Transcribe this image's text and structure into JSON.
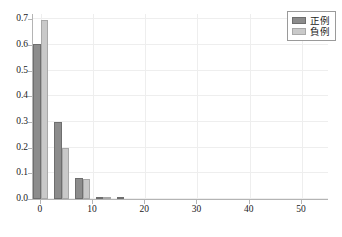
{
  "chart_data": {
    "type": "bar",
    "title": "",
    "subtitle": "",
    "xlabel": "",
    "ylabel": "",
    "xlim": [
      -1.5,
      55
    ],
    "ylim": [
      0.0,
      0.72
    ],
    "grid": true,
    "legend_position": "top-right",
    "x": [
      0,
      4,
      8,
      12,
      16
    ],
    "xticks": [
      "0",
      "10",
      "20",
      "30",
      "40",
      "50"
    ],
    "xtick_values": [
      0,
      10,
      20,
      30,
      40,
      50
    ],
    "yticks": [
      "0.0",
      "0.1",
      "0.2",
      "0.3",
      "0.4",
      "0.5",
      "0.6",
      "0.7"
    ],
    "ytick_values": [
      0.0,
      0.1,
      0.2,
      0.3,
      0.4,
      0.5,
      0.6,
      0.7
    ],
    "series": [
      {
        "name": "正例",
        "color": "#8c8c8c",
        "edge_color": "#6e6e6e",
        "values": [
          0.605,
          0.3,
          0.08,
          0.005,
          0.004
        ]
      },
      {
        "name": "負例",
        "color": "#c9c9c9",
        "edge_color": "#a8a8a8",
        "values": [
          0.695,
          0.2,
          0.078,
          0.008,
          0.0
        ]
      }
    ]
  },
  "legend": {
    "entries": [
      {
        "label": "正例"
      },
      {
        "label": "負例"
      }
    ]
  }
}
